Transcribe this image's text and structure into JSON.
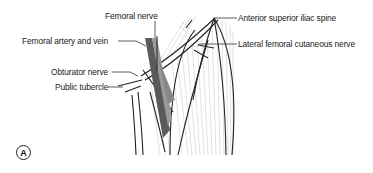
{
  "figure": {
    "panel_letter": "A",
    "labels": [
      {
        "id": "femoral-nerve",
        "text": "Femoral nerve"
      },
      {
        "id": "femoral-artery-vein",
        "text": "Femoral artery and vein"
      },
      {
        "id": "obturator-nerve",
        "text": "Obturator nerve"
      },
      {
        "id": "pubic-tubercle",
        "text": "Public tubercle"
      },
      {
        "id": "asis",
        "text": "Anterior superior iliac spine"
      },
      {
        "id": "lfcn",
        "text": "Lateral femoral cutaneous nerve"
      }
    ]
  },
  "colors": {
    "line": "#222222",
    "hatch": "#b5b5b5",
    "vessel_dark": "#4a4a4a",
    "vessel_mid": "#8a8a8a",
    "background": "#ffffff"
  }
}
